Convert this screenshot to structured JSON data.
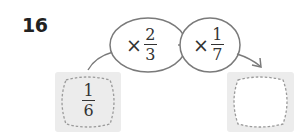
{
  "problem": {
    "number": "16",
    "start_value": {
      "numerator": "1",
      "denominator": "6"
    },
    "operations": [
      {
        "symbol": "×",
        "numerator": "2",
        "denominator": "3"
      },
      {
        "symbol": "×",
        "numerator": "1",
        "denominator": "7"
      }
    ],
    "answer": ""
  },
  "colors": {
    "box_fill": "#ececec",
    "dashed_stroke": "#9a9a9a",
    "oval_stroke": "#7a7a7a",
    "text": "#333333"
  }
}
